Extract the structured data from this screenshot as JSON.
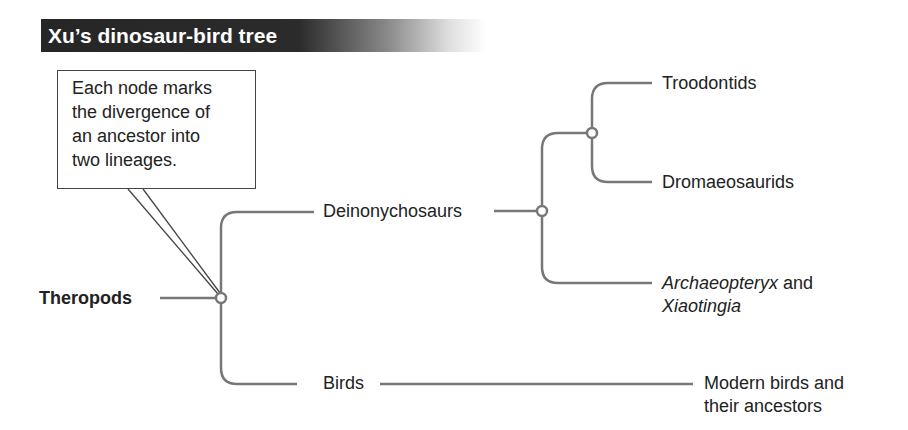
{
  "title": "Xu’s dinosaur-bird tree",
  "callout": {
    "text": "Each node marks the divergence of an ancestor into two lineages.",
    "lines": [
      "Each node marks",
      "the divergence of",
      "an ancestor into",
      "two lineages."
    ]
  },
  "tree": {
    "root": "Theropods",
    "branches": {
      "deinonychosaurs": "Deinonychosaurs",
      "troodontids": "Troodontids",
      "dromaeosaurids": "Dromaeosaurids",
      "archaeopteryx_italic": "Archaeopteryx",
      "archaeopteryx_and": " and",
      "xiaotingia_italic": "Xiaotingia",
      "birds": "Birds",
      "modern_birds_line1": "Modern birds and",
      "modern_birds_line2": "their ancestors"
    }
  },
  "colors": {
    "line": "#777777",
    "banner": "#2a2a2a",
    "text": "#222222"
  }
}
